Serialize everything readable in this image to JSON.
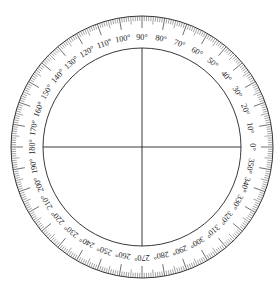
{
  "diagram": {
    "type": "full-circle-protractor",
    "center": [
      142,
      147
    ],
    "outer_radius": 131,
    "inner_radius": 99,
    "label_radius": 110,
    "tick_step_deg": 1,
    "major_tick_every_deg": 10,
    "mid_tick_every_deg": 5,
    "label_step_deg": 10,
    "degree_symbol": "°",
    "labels": [
      "0°",
      "10°",
      "20°",
      "30°",
      "40°",
      "50°",
      "60°",
      "70°",
      "80°",
      "90°",
      "100°",
      "110°",
      "120°",
      "130°",
      "140°",
      "150°",
      "160°",
      "170°",
      "180°",
      "190°",
      "200°",
      "210°",
      "220°",
      "230°",
      "240°",
      "250°",
      "260°",
      "270°",
      "280°",
      "290°",
      "300°",
      "310°",
      "320°",
      "330°",
      "340°",
      "350°"
    ],
    "crosshair": {
      "horizontal": true,
      "vertical": true
    },
    "colors": {
      "line": "#222222",
      "background": "#ffffff"
    }
  }
}
